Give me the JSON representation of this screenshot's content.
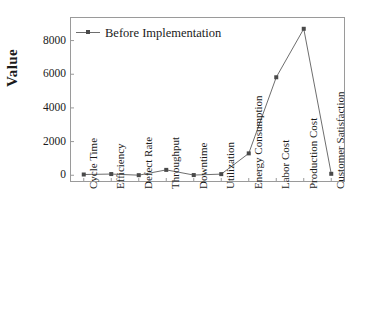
{
  "chart_data": {
    "type": "line",
    "title": "",
    "xlabel": "",
    "ylabel": "Value",
    "categories": [
      "Cycle Time",
      "Efficiency",
      "Defect Rate",
      "Throughput",
      "Downtime",
      "Utilization",
      "Energy Consumption",
      "Labor Cost",
      "Production Cost",
      "Customer Satisfaction"
    ],
    "series": [
      {
        "name": "Before Implementation",
        "values": [
          45,
          72,
          5,
          320,
          12,
          68,
          1300,
          5820,
          8700,
          87
        ],
        "color": "#6e6e6e",
        "marker": "square",
        "marker_color": "#4a4a4a"
      }
    ],
    "yticks": [
      0,
      2000,
      4000,
      6000,
      8000
    ],
    "ytick_labels": [
      "0",
      "2000",
      "4000",
      "6000",
      "8000"
    ],
    "ylim": [
      -400,
      9400
    ],
    "grid": false,
    "legend_position": "top-left",
    "frame": true
  },
  "legend": {
    "entries": [
      {
        "label": "Before Implementation"
      }
    ]
  },
  "axes": {
    "y_title": "Value"
  },
  "colors": {
    "line": "#6e6e6e",
    "marker": "#4a4a4a",
    "frame": "#9a9a9a",
    "text": "#1a1a1a",
    "background": "#ffffff"
  }
}
